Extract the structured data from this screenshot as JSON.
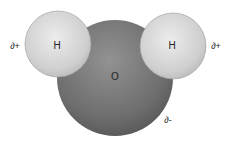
{
  "diagram": {
    "atoms": [
      {
        "id": "oxygen",
        "symbol": "O",
        "charge": "∂-",
        "cx": 115,
        "cy": 78,
        "r": 58
      },
      {
        "id": "hydrogen-left",
        "symbol": "H",
        "charge": "∂+",
        "cx": 58,
        "cy": 44,
        "r": 33
      },
      {
        "id": "hydrogen-right",
        "symbol": "H",
        "charge": "∂+",
        "cx": 173,
        "cy": 46,
        "r": 33
      }
    ],
    "labels": {
      "oxygen": "O",
      "hydrogen_left": "H",
      "hydrogen_right": "H",
      "charge_left": "∂+",
      "charge_right": "∂+",
      "charge_oxygen": "∂-"
    },
    "colors": {
      "oxygen_light": "#8c8c8c",
      "oxygen_dark": "#5a5a5a",
      "hydrogen_light": "#e6e6e6",
      "hydrogen_dark": "#b4b4b4",
      "text": "#222222"
    }
  }
}
